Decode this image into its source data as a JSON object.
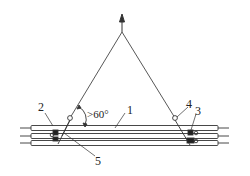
{
  "figure": {
    "labels": {
      "pipe": "1",
      "left_part": "2",
      "right_part": "3",
      "shackle": "4",
      "sling_clamp": "5",
      "angle": ">60°"
    },
    "colors": {
      "line": "#333333",
      "background": "#ffffff"
    }
  }
}
